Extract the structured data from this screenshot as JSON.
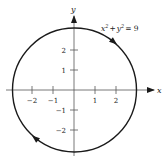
{
  "figure": {
    "equation": "x² + y² = 9",
    "equation_parts": {
      "x": "x",
      "xexp": "2",
      "plus": "+",
      "y": "y",
      "yexp": "2",
      "eq": "= 9"
    },
    "x_axis_label": "x",
    "y_axis_label": "y",
    "x_ticks": [
      "−2",
      "−1",
      "1",
      "2"
    ],
    "y_ticks": [
      "2",
      "1",
      "−1",
      "−2"
    ],
    "orientation": "clockwise",
    "radius": 3,
    "colors": {
      "stroke": "#1a1a1a",
      "background": "#ffffff"
    }
  }
}
